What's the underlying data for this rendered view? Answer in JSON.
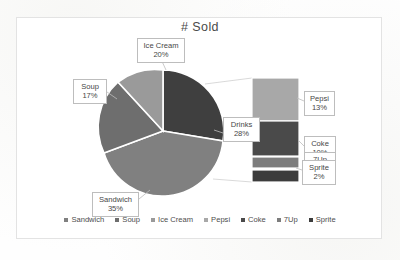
{
  "chart": {
    "title": "# Sold",
    "type": "bar-of-pie"
  },
  "labels": {
    "ice_cream": {
      "name": "Ice Cream",
      "pct": "20%"
    },
    "soup": {
      "name": "Soup",
      "pct": "17%"
    },
    "sandwich": {
      "name": "Sandwich",
      "pct": "35%"
    },
    "drinks": {
      "name": "Drinks",
      "pct": "28%"
    },
    "pepsi": {
      "name": "Pepsi",
      "pct": "13%"
    },
    "coke": {
      "name": "Coke",
      "pct": "10%"
    },
    "sevenup": {
      "name": "7Up",
      "pct": "3%"
    },
    "sprite": {
      "name": "Sprite",
      "pct": "2%"
    }
  },
  "legend": [
    {
      "label": "Sandwich",
      "color": "#808080"
    },
    {
      "label": "Soup",
      "color": "#6e6e6e"
    },
    {
      "label": "Ice Cream",
      "color": "#9a9a9a"
    },
    {
      "label": "Pepsi",
      "color": "#a8a8a8"
    },
    {
      "label": "Coke",
      "color": "#4a4a4a"
    },
    {
      "label": "7Up",
      "color": "#7d7d7d"
    },
    {
      "label": "Sprite",
      "color": "#3c3c3c"
    }
  ],
  "chart_data": {
    "type": "pie",
    "title": "# Sold",
    "xlabel": "",
    "ylabel": "",
    "categories": [
      "Sandwich",
      "Soup",
      "Ice Cream",
      "Drinks"
    ],
    "values": [
      35,
      17,
      20,
      28
    ],
    "slice_colors": [
      "#808080",
      "#6e6e6e",
      "#9a9a9a",
      "#3f3f3f"
    ],
    "legend_position": "bottom",
    "grid": false,
    "secondary_plot": {
      "type": "bar",
      "name": "Drinks breakdown",
      "note": "Stacked bar expanding the Drinks slice (28%)",
      "categories": [
        "Pepsi",
        "Coke",
        "7Up",
        "Sprite"
      ],
      "values": [
        13,
        10,
        3,
        2
      ],
      "colors": [
        "#a8a8a8",
        "#4a4a4a",
        "#7d7d7d",
        "#3c3c3c"
      ]
    }
  }
}
